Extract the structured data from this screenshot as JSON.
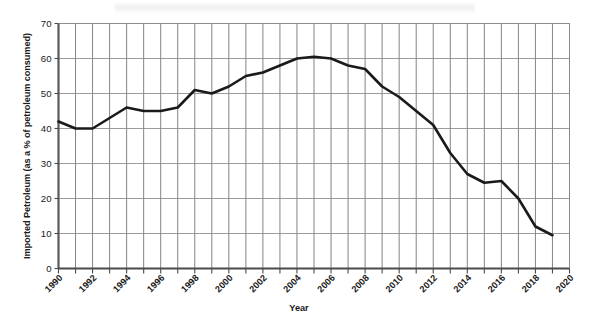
{
  "chart_data": {
    "type": "line",
    "title": "",
    "xlabel": "Year",
    "ylabel": "Imported Petroleum (as a % of petroleum consumed)",
    "xlim": [
      1990,
      2020
    ],
    "ylim": [
      0,
      70
    ],
    "grid": true,
    "legend": false,
    "y_ticks": [
      0,
      10,
      20,
      30,
      40,
      50,
      60,
      70
    ],
    "y_tick_labels": [
      "0",
      "10",
      "20",
      "30",
      "40",
      "50",
      "60",
      "70"
    ],
    "x_ticks": [
      1990,
      1991,
      1992,
      1993,
      1994,
      1995,
      1996,
      1997,
      1998,
      1999,
      2000,
      2001,
      2002,
      2003,
      2004,
      2005,
      2006,
      2007,
      2008,
      2009,
      2010,
      2011,
      2012,
      2013,
      2014,
      2015,
      2016,
      2017,
      2018,
      2019,
      2020
    ],
    "x_tick_labels": [
      "1990",
      "1992",
      "1994",
      "1996",
      "1998",
      "2000",
      "2002",
      "2004",
      "2006",
      "2008",
      "2010",
      "2012",
      "2014",
      "2016",
      "2018",
      "2020"
    ],
    "x_tick_label_years": [
      1990,
      1992,
      1994,
      1996,
      1998,
      2000,
      2002,
      2004,
      2006,
      2008,
      2010,
      2012,
      2014,
      2016,
      2018,
      2020
    ],
    "line_color": "#1a1a1a",
    "line_width": 2.6,
    "x": [
      1990,
      1991,
      1992,
      1993,
      1994,
      1995,
      1996,
      1997,
      1998,
      1999,
      2000,
      2001,
      2002,
      2003,
      2004,
      2005,
      2006,
      2007,
      2008,
      2009,
      2010,
      2011,
      2012,
      2013,
      2014,
      2015,
      2016,
      2017,
      2018,
      2019
    ],
    "values": [
      42,
      40,
      40,
      43,
      46,
      45,
      45,
      46,
      51,
      50,
      52,
      55,
      56,
      58,
      60,
      60.5,
      60,
      58,
      57,
      52,
      49,
      45,
      41,
      33,
      27,
      24.5,
      25,
      20,
      12,
      9.5
    ],
    "series": [
      {
        "name": "Imported Petroleum",
        "values": [
          42,
          40,
          40,
          43,
          46,
          45,
          45,
          46,
          51,
          50,
          52,
          55,
          56,
          58,
          60,
          60.5,
          60,
          58,
          57,
          52,
          49,
          45,
          41,
          33,
          27,
          24.5,
          25,
          20,
          12,
          9.5
        ]
      }
    ]
  }
}
